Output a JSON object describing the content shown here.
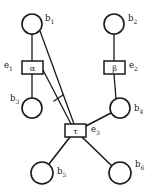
{
  "diagram": {
    "type": "bipartite-graph",
    "title": "",
    "background_color": "#ffffff",
    "stroke_color": "#1a1a1a",
    "width": 160,
    "height": 194,
    "circle_nodes": [
      {
        "id": "b1",
        "label": "b",
        "subscript": "1",
        "cx": 32,
        "cy": 24,
        "r": 10,
        "label_x": 45,
        "label_y": 21
      },
      {
        "id": "b2",
        "label": "b",
        "subscript": "2",
        "cx": 114,
        "cy": 24,
        "r": 10,
        "label_x": 128,
        "label_y": 21
      },
      {
        "id": "b3",
        "label": "b",
        "subscript": "3",
        "cx": 32,
        "cy": 108,
        "r": 10,
        "label_x": 12,
        "label_y": 101
      },
      {
        "id": "b4",
        "label": "b",
        "subscript": "4",
        "cx": 120,
        "cy": 108,
        "r": 10,
        "label_x": 135,
        "label_y": 110
      },
      {
        "id": "b5",
        "label": "b",
        "subscript": "5",
        "cx": 42,
        "cy": 173,
        "r": 11,
        "label_x": 58,
        "label_y": 172
      },
      {
        "id": "b6",
        "label": "b",
        "subscript": "6",
        "cx": 120,
        "cy": 173,
        "r": 11,
        "label_x": 136,
        "label_y": 167
      }
    ],
    "box_nodes": [
      {
        "id": "alpha",
        "glyph": "α",
        "x": 22,
        "y": 61,
        "w": 21,
        "h": 13,
        "ext_label": "e",
        "ext_subscript": "1",
        "ext_x": 5,
        "ext_y": 67
      },
      {
        "id": "beta",
        "glyph": "β",
        "x": 104,
        "y": 61,
        "w": 21,
        "h": 13,
        "ext_label": "e",
        "ext_subscript": "2",
        "ext_x": 130,
        "ext_y": 67
      },
      {
        "id": "tau",
        "glyph": "τ",
        "x": 65,
        "y": 124,
        "w": 21,
        "h": 13,
        "ext_label": "e",
        "ext_subscript": "3",
        "ext_x": 92,
        "ext_y": 131
      }
    ],
    "edges": [
      {
        "id": "b1-alpha",
        "from": "b1",
        "to": "alpha",
        "style": "thin"
      },
      {
        "id": "alpha-b3",
        "from": "alpha",
        "to": "b3",
        "style": "thin"
      },
      {
        "id": "b2-beta",
        "from": "b2",
        "to": "beta",
        "style": "thin"
      },
      {
        "id": "beta-b4",
        "from": "beta",
        "to": "b4",
        "style": "thin"
      },
      {
        "id": "b1-tau",
        "from": "b1",
        "to": "tau",
        "style": "thin"
      },
      {
        "id": "alpha-tau",
        "from": "alpha",
        "to": "tau",
        "style": "thin"
      },
      {
        "id": "tau-b4",
        "from": "tau",
        "to": "b4",
        "style": "thick"
      },
      {
        "id": "tau-b5",
        "from": "tau",
        "to": "b5",
        "style": "thick"
      },
      {
        "id": "tau-b6",
        "from": "tau",
        "to": "b6",
        "style": "thick"
      }
    ],
    "tick_marks": [
      {
        "id": "hash-mark",
        "x": 58,
        "y": 99
      }
    ]
  }
}
